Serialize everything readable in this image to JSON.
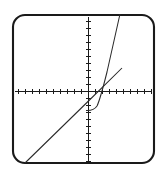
{
  "figure": {
    "title": "Graphing calculator plot of a line and an exponential curve",
    "background_color": "#ffffff",
    "frame_color": "#1a1a1a",
    "curve_color": "#2a2a2a"
  },
  "chart_data": {
    "type": "line",
    "title": "",
    "subtitle": "",
    "xlabel": "",
    "ylabel": "",
    "xlim": [
      -10,
      10
    ],
    "ylim": [
      -10,
      10
    ],
    "grid": false,
    "legend": "none",
    "axes": {
      "x_axis_shown": true,
      "y_axis_shown": true,
      "tick_spacing_x": 1,
      "tick_spacing_y": 1,
      "tick_labels_shown": false,
      "origin_x_px": 88.5,
      "origin_y_px": 91.5,
      "pixels_per_unit": 7.0
    },
    "series": [
      {
        "name": "line",
        "type": "line",
        "equation": "y = x + 1.5",
        "x": [
          -9.1,
          -7,
          -5,
          -3,
          -1,
          0,
          1,
          2,
          3,
          4.4
        ],
        "y": [
          -10.2,
          -8.1,
          -6.1,
          -4.1,
          -2.1,
          -1.5,
          -0.5,
          0.5,
          1.5,
          3.1
        ],
        "path_px": "M 25,163 L 88.5,101 L 122,68",
        "style": "solid"
      },
      {
        "name": "exponential",
        "type": "line",
        "equation": "y = a*b^x - 2.6",
        "asymptote_y": -2.6,
        "x": [
          -7,
          -5,
          -4,
          -3,
          -2.2,
          -1.6,
          -1,
          -0.4,
          0.2,
          0.8,
          1.4,
          2,
          2.6,
          3.2,
          3.8,
          4.5
        ],
        "y": [
          -2.6,
          -2.6,
          -2.6,
          -2.58,
          -2.5,
          -2.35,
          -2.0,
          -1.35,
          -0.2,
          1.0,
          2.6,
          4.4,
          6.3,
          8.3,
          10.2,
          12.6
        ],
        "path_px": "M 86,110.5 C 90,110.8 94,110.4 97,106 C 100,100 103,88 107,72 C 110,58 114,40 120,14",
        "style": "solid"
      }
    ],
    "annotations": [
      {
        "name": "intersection",
        "x_px": 98,
        "y_px": 91.5,
        "description": "line and curve cross near the x-axis to the right of the origin"
      }
    ]
  },
  "ticks": {
    "x_positions_px": [
      18.5,
      25.5,
      32.5,
      39.5,
      46.5,
      53.5,
      60.5,
      67.5,
      74.5,
      81.5,
      95.5,
      102.5,
      109.5,
      116.5,
      123.5,
      130.5,
      137.5,
      144.5,
      151.5
    ],
    "y_positions_px": [
      21.5,
      28.5,
      35.5,
      42.5,
      49.5,
      56.5,
      63.5,
      70.5,
      77.5,
      84.5,
      98.5,
      105.5,
      112.5,
      119.5,
      126.5,
      133.5,
      140.5,
      147.5,
      154.5,
      161.5
    ],
    "tick_half_length_px": 2.5
  },
  "frame": {
    "x_px": 13,
    "y_px": 15,
    "width_px": 141,
    "height_px": 148,
    "corner_radius_px": 12
  }
}
